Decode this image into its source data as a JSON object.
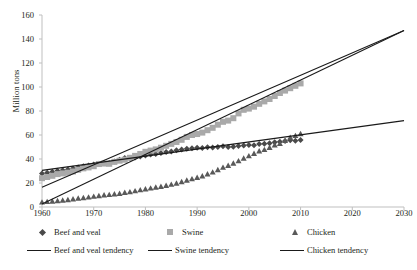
{
  "chart_data": {
    "type": "line",
    "title": "",
    "subtitle": "",
    "xlabel": "",
    "ylabel": "Million tons",
    "xlim": [
      1960,
      2030
    ],
    "ylim": [
      0,
      160
    ],
    "xticks": [
      1960,
      1970,
      1980,
      1990,
      2000,
      2010,
      2020,
      2030
    ],
    "yticks": [
      0,
      20,
      40,
      60,
      80,
      100,
      120,
      140,
      160
    ],
    "grid": false,
    "legend_position": "bottom",
    "legend": [
      "Beef and veal",
      "Swine",
      "Chicken",
      "Beef and veal tendency",
      "Swine tendency",
      "Chicken tendency"
    ],
    "colors": {
      "beef_marker": "#4a4a4a",
      "swine_marker": "#a9a9a9",
      "chicken_marker": "#595959",
      "tendency_line": "#1a1a1a",
      "axis": "#bfbfbf",
      "text": "#231f20"
    },
    "x": [
      1960,
      1961,
      1962,
      1963,
      1964,
      1965,
      1966,
      1967,
      1968,
      1969,
      1970,
      1971,
      1972,
      1973,
      1974,
      1975,
      1976,
      1977,
      1978,
      1979,
      1980,
      1981,
      1982,
      1983,
      1984,
      1985,
      1986,
      1987,
      1988,
      1989,
      1990,
      1991,
      1992,
      1993,
      1994,
      1995,
      1996,
      1997,
      1998,
      1999,
      2000,
      2001,
      2002,
      2003,
      2004,
      2005,
      2006,
      2007,
      2008,
      2009,
      2010
    ],
    "series": [
      {
        "name": "Beef and veal",
        "marker": "diamond",
        "values": [
          28,
          28.6,
          29.3,
          30.2,
          30.6,
          31.2,
          32.1,
          33.0,
          34.0,
          34.6,
          35.4,
          36.0,
          36.8,
          36.6,
          38.0,
          39.4,
          40.8,
          40.9,
          41.3,
          42.0,
          43.0,
          43.8,
          44.2,
          45.0,
          45.8,
          46.3,
          47.2,
          48.0,
          48.6,
          49.0,
          49.4,
          49.2,
          49.8,
          49.5,
          50.0,
          50.6,
          50.0,
          50.2,
          50.8,
          51.2,
          51.6,
          51.4,
          52.4,
          52.8,
          53.1,
          53.9,
          54.4,
          55.0,
          55.6,
          55.3,
          55.8
        ],
        "end_value": 56
      },
      {
        "name": "Swine",
        "marker": "square",
        "values": [
          24,
          25.0,
          26.0,
          27.4,
          28.0,
          28.6,
          29.6,
          31.0,
          32.2,
          33.0,
          34.0,
          35.8,
          36.2,
          36.0,
          37.6,
          38.6,
          39.4,
          41.0,
          42.6,
          44.2,
          46.0,
          47.0,
          48.0,
          49.4,
          51.0,
          52.6,
          54.2,
          56.0,
          58.4,
          60.0,
          60.8,
          62.0,
          64.0,
          66.0,
          68.6,
          71.0,
          72.0,
          74.0,
          78.0,
          81.0,
          82.0,
          83.6,
          86.0,
          88.0,
          90.0,
          92.5,
          95.0,
          97.0,
          99.0,
          101.0,
          103.0
        ],
        "end_value": 103
      },
      {
        "name": "Chicken",
        "marker": "triangle",
        "values": [
          4,
          4.4,
          4.8,
          5.2,
          5.6,
          6.0,
          6.6,
          7.2,
          7.7,
          8.2,
          8.8,
          9.3,
          9.9,
          10.3,
          10.8,
          11.2,
          12.0,
          12.6,
          13.4,
          14.2,
          15.0,
          15.7,
          16.4,
          17.0,
          17.9,
          18.8,
          19.8,
          21.0,
          22.2,
          23.4,
          24.6,
          25.8,
          27.4,
          29.0,
          31.0,
          33.0,
          34.6,
          36.4,
          38.4,
          40.6,
          42.6,
          44.6,
          46.6,
          47.8,
          49.6,
          51.6,
          52.8,
          55.4,
          58.0,
          59.4,
          61.0
        ],
        "end_value": 61
      }
    ],
    "tendencies": [
      {
        "name": "Beef and veal tendency",
        "x0": 1960,
        "y0": 30.5,
        "x1": 2030,
        "y1": 72
      },
      {
        "name": "Swine tendency",
        "x0": 1960,
        "y0": 16.5,
        "x1": 2030,
        "y1": 147
      },
      {
        "name": "Chicken tendency",
        "x0": 1960,
        "y0": 2.5,
        "x1": 2030,
        "y1": 147
      }
    ]
  }
}
